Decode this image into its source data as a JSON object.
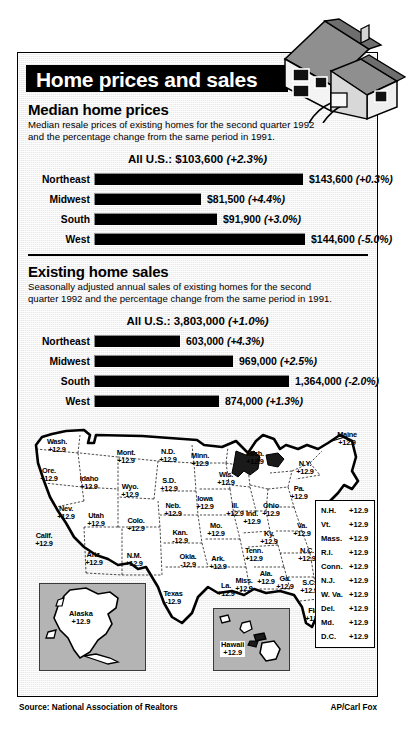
{
  "header": {
    "title": "Home prices and sales"
  },
  "icons": {
    "house": "house-illustration",
    "map": "us-map"
  },
  "prices": {
    "title": "Median home prices",
    "description": "Median resale prices of existing homes for the second quarter 1992 and the percentage change from the same period in 1991.",
    "all_us_label": "All U.S.: $103,600",
    "all_us_change": "(+2.3%)"
  },
  "sales": {
    "title": "Existing home sales",
    "description": "Seasonally adjusted annual sales of existing homes for the second quarter 1992 and the percentage change from the same period in 1991.",
    "all_us_label": "All U.S.: 3,803,000",
    "all_us_change": "(+1.0%)"
  },
  "footer": {
    "source": "Source: National Association of Realtors",
    "credit": "AP/Carl Fox"
  },
  "chart_data": [
    {
      "type": "bar",
      "title": "Median home prices",
      "subtitle": "Median resale prices of existing homes for the second quarter 1992 and the percentage change from the same period in 1991.",
      "orientation": "horizontal",
      "categories": [
        "Northeast",
        "Midwest",
        "South",
        "West"
      ],
      "values": [
        143600,
        91500,
        91900,
        144600
      ],
      "value_labels": [
        "$143,600",
        "$81,500",
        "$91,900",
        "$144,600"
      ],
      "change_labels": [
        "(+0.3%)",
        "(+4.4%)",
        "(+3.0%)",
        "(-5.0%)"
      ],
      "changes": [
        0.3,
        4.4,
        3.0,
        -5.0
      ],
      "total_label": "All U.S.: $103,600",
      "total_change": "(+2.3%)",
      "total_value": 103600,
      "unit": "USD",
      "xlabel": "",
      "ylabel": "",
      "grid": false,
      "legend": "none",
      "bar_pixel_widths": [
        209,
        107,
        123,
        211
      ]
    },
    {
      "type": "bar",
      "title": "Existing home sales",
      "subtitle": "Seasonally adjusted annual sales of existing homes for the second quarter 1992 and the percentage change from the same period in 1991.",
      "orientation": "horizontal",
      "categories": [
        "Northeast",
        "Midwest",
        "South",
        "West"
      ],
      "values": [
        603000,
        969000,
        1364000,
        874000
      ],
      "value_labels": [
        "603,000",
        "969,000",
        "1,364,000",
        "874,000"
      ],
      "change_labels": [
        "(+4.3%)",
        "(+2.5%)",
        "(-2.0%)",
        "(+1.3%)"
      ],
      "changes": [
        4.3,
        2.5,
        -2.0,
        1.3
      ],
      "total_label": "All U.S.: 3,803,000",
      "total_change": "(+1.0%)",
      "total_value": 3803000,
      "unit": "homes",
      "xlabel": "",
      "ylabel": "",
      "grid": false,
      "legend": "none",
      "bar_pixel_widths": [
        86,
        139,
        195,
        125
      ]
    }
  ],
  "map": {
    "states": [
      {
        "name": "Wash.",
        "value": "+12.9",
        "x": 35,
        "y": 11
      },
      {
        "name": "Ore.",
        "value": "+12.9",
        "x": 27,
        "y": 40
      },
      {
        "name": "Calif.",
        "value": "+12.9",
        "x": 22,
        "y": 105
      },
      {
        "name": "Idaho",
        "value": "+12.9",
        "x": 67,
        "y": 48
      },
      {
        "name": "Nev.",
        "value": "+12.9",
        "x": 44,
        "y": 78
      },
      {
        "name": "Mont.",
        "value": "+12.9",
        "x": 104,
        "y": 22
      },
      {
        "name": "Wyo.",
        "value": "+12.9",
        "x": 108,
        "y": 56
      },
      {
        "name": "Utah",
        "value": "+12.9",
        "x": 74,
        "y": 85
      },
      {
        "name": "Ariz.",
        "value": "+12.9",
        "x": 72,
        "y": 124
      },
      {
        "name": "Colo.",
        "value": "+12.9",
        "x": 114,
        "y": 90
      },
      {
        "name": "N.M.",
        "value": "+12.9",
        "x": 112,
        "y": 125
      },
      {
        "name": "N.D.",
        "value": "+12.9",
        "x": 146,
        "y": 21
      },
      {
        "name": "S.D.",
        "value": "+12.9",
        "x": 147,
        "y": 50
      },
      {
        "name": "Neb.",
        "value": "+12.9",
        "x": 151,
        "y": 75
      },
      {
        "name": "Kan.",
        "value": "-12.9",
        "x": 158,
        "y": 102
      },
      {
        "name": "Okla.",
        "value": "-12.9",
        "x": 166,
        "y": 126
      },
      {
        "name": "Texas",
        "value": "-12.9",
        "x": 151,
        "y": 163
      },
      {
        "name": "Minn.",
        "value": "+12.9",
        "x": 178,
        "y": 25
      },
      {
        "name": "Iowa",
        "value": "+12.9",
        "x": 183,
        "y": 68
      },
      {
        "name": "Mo.",
        "value": "+12.9",
        "x": 194,
        "y": 95
      },
      {
        "name": "Ark.",
        "value": "+12.9",
        "x": 196,
        "y": 128
      },
      {
        "name": "La.",
        "value": "+12.9",
        "x": 204,
        "y": 155
      },
      {
        "name": "Wis.",
        "value": "+12.9",
        "x": 204,
        "y": 44
      },
      {
        "name": "Ill.",
        "value": "+12.9",
        "x": 213,
        "y": 75
      },
      {
        "name": "Miss.",
        "value": "+12.9",
        "x": 222,
        "y": 150
      },
      {
        "name": "Mich.",
        "value": "+12.9",
        "x": 233,
        "y": 23
      },
      {
        "name": "Ind.",
        "value": "+12.9",
        "x": 230,
        "y": 83
      },
      {
        "name": "Ohio",
        "value": "+12.9",
        "x": 249,
        "y": 75
      },
      {
        "name": "Ky.",
        "value": "+12.9",
        "x": 247,
        "y": 103
      },
      {
        "name": "Tenn.",
        "value": "+12.9",
        "x": 232,
        "y": 120
      },
      {
        "name": "Ala.",
        "value": "+12.9",
        "x": 244,
        "y": 143
      },
      {
        "name": "Ga.",
        "value": "+12.9",
        "x": 263,
        "y": 148
      },
      {
        "name": "Fla.",
        "value": "+12.9",
        "x": 292,
        "y": 180
      },
      {
        "name": "S.C.",
        "value": "+12.9",
        "x": 287,
        "y": 152
      },
      {
        "name": "N.C.",
        "value": "+12.9",
        "x": 285,
        "y": 120
      },
      {
        "name": "Va.",
        "value": "+12.9",
        "x": 280,
        "y": 95
      },
      {
        "name": "Pa.",
        "value": "+12.9",
        "x": 277,
        "y": 58
      },
      {
        "name": "N.Y.",
        "value": "+12.9",
        "x": 283,
        "y": 33
      },
      {
        "name": "Maine",
        "value": "+12.9",
        "x": 325,
        "y": 4
      }
    ],
    "insets": [
      {
        "name": "Alaska",
        "value": "+12.9"
      },
      {
        "name": "Hawaii",
        "value": "+12.9"
      }
    ],
    "legend": [
      {
        "abbr": "N.H.",
        "value": "+12.9"
      },
      {
        "abbr": "Vt.",
        "value": "+12.9"
      },
      {
        "abbr": "Mass.",
        "value": "+12.9"
      },
      {
        "abbr": "R.I.",
        "value": "+12.9"
      },
      {
        "abbr": "Conn.",
        "value": "+12.9"
      },
      {
        "abbr": "N.J.",
        "value": "+12.9"
      },
      {
        "abbr": "W. Va.",
        "value": "+12.9"
      },
      {
        "abbr": "Del.",
        "value": "+12.9"
      },
      {
        "abbr": "Md.",
        "value": "+12.9"
      },
      {
        "abbr": "D.C.",
        "value": "+12.9"
      }
    ]
  },
  "colors": {
    "ink": "#000000",
    "panel": "#e9e9e9",
    "inset": "#b4b4b4",
    "roof": "#9a9a9a"
  }
}
